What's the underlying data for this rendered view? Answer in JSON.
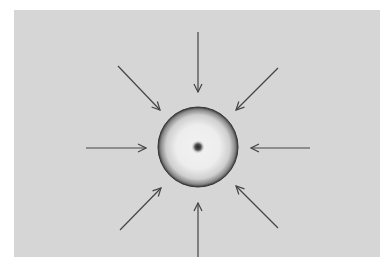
{
  "diagram": {
    "background_color": "#d6d6d6",
    "arrow_color": "#444444",
    "sphere": {
      "cx": 198,
      "cy": 147,
      "r": 40,
      "center_dot": true
    },
    "arrows": [
      {
        "name": "arrow-top",
        "x1": 198,
        "y1": 32,
        "x2": 198,
        "y2": 92
      },
      {
        "name": "arrow-top-right",
        "x1": 278,
        "y1": 68,
        "x2": 236,
        "y2": 110
      },
      {
        "name": "arrow-right",
        "x1": 310,
        "y1": 148,
        "x2": 251,
        "y2": 148
      },
      {
        "name": "arrow-bottom-right",
        "x1": 278,
        "y1": 228,
        "x2": 236,
        "y2": 186
      },
      {
        "name": "arrow-bottom",
        "x1": 198,
        "y1": 257,
        "x2": 198,
        "y2": 203
      },
      {
        "name": "arrow-bottom-left",
        "x1": 120,
        "y1": 230,
        "x2": 161,
        "y2": 188
      },
      {
        "name": "arrow-left",
        "x1": 86,
        "y1": 148,
        "x2": 146,
        "y2": 148
      },
      {
        "name": "arrow-top-left",
        "x1": 118,
        "y1": 66,
        "x2": 160,
        "y2": 110
      }
    ]
  }
}
